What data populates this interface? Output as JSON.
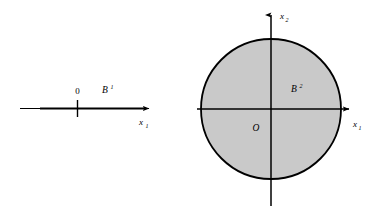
{
  "figure": {
    "background_color": "#ffffff",
    "stroke_color": "#000000",
    "fill_color": "#c9c9c9",
    "panels": [
      {
        "name": "one-dimensional-ball",
        "set_label": "B",
        "set_superscript": "1",
        "origin_label": "0",
        "axis_label": "x",
        "axis_subscript": "1",
        "axis_line": {
          "x1": 20,
          "x2": 152,
          "y": 108
        },
        "arrow_tip_x": 152,
        "tick": {
          "x": 77,
          "y1": 100,
          "y2": 116
        },
        "segment": {
          "x1": 40,
          "x2": 145,
          "y": 108
        },
        "label_positions": {
          "origin": {
            "x": 77,
            "y": 94
          },
          "set": {
            "x": 105,
            "y": 93
          },
          "axis": {
            "x": 141,
            "y": 124
          }
        }
      },
      {
        "name": "two-dimensional-ball",
        "set_label": "B",
        "set_superscript": "2",
        "origin_label": "O",
        "x_axis_label": "x",
        "x_axis_subscript": "1",
        "y_axis_label": "x",
        "y_axis_subscript": "2",
        "circle": {
          "cx": 271,
          "cy": 109,
          "r": 70
        },
        "x_axis": {
          "x1": 197,
          "x2": 352,
          "y": 109
        },
        "y_axis": {
          "x": 271,
          "y1": 12,
          "y2": 206
        },
        "label_positions": {
          "y_axis": {
            "x": 280,
            "y": 19
          },
          "set": {
            "x": 294,
            "y": 92
          },
          "origin": {
            "x": 252,
            "y": 131
          },
          "x_axis": {
            "x": 353,
            "y": 127
          }
        }
      }
    ]
  }
}
